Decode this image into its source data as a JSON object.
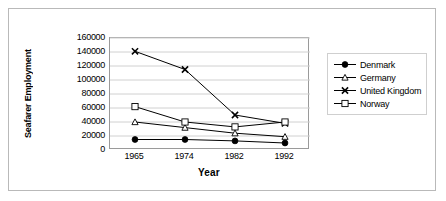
{
  "chart_data": {
    "type": "line",
    "title": "",
    "xlabel": "Year",
    "ylabel": "Seafarer Employment",
    "categories": [
      "1965",
      "1974",
      "1982",
      "1992"
    ],
    "x": [
      1965,
      1974,
      1982,
      1992
    ],
    "ylim": [
      0,
      160000
    ],
    "yticks": [
      160000,
      140000,
      120000,
      100000,
      80000,
      60000,
      40000,
      20000,
      0
    ],
    "ytick_labels": [
      "160000",
      "140000",
      "120000",
      "100000",
      "80000",
      "60000",
      "40000",
      "20000",
      "0"
    ],
    "grid": true,
    "legend_position": "right",
    "series": [
      {
        "name": "Denmark",
        "marker": "filled-diamond",
        "values": [
          15000,
          15000,
          13000,
          10000
        ]
      },
      {
        "name": "Germany",
        "marker": "open-triangle",
        "values": [
          40000,
          32000,
          24000,
          19000
        ]
      },
      {
        "name": "United Kingdom",
        "marker": "cross-x",
        "values": [
          141000,
          115000,
          50000,
          38000
        ]
      },
      {
        "name": "Norway",
        "marker": "open-square",
        "values": [
          62000,
          40000,
          33000,
          40000
        ]
      }
    ]
  },
  "legend": {
    "items": [
      {
        "label": "Denmark"
      },
      {
        "label": "Germany"
      },
      {
        "label": "United Kingdom"
      },
      {
        "label": "Norway"
      }
    ]
  },
  "colors": {
    "line": "#000000",
    "grid": "#d0d0d0",
    "axis": "#9a9a9a",
    "frame": "#b9b9b9",
    "background": "#ffffff"
  }
}
